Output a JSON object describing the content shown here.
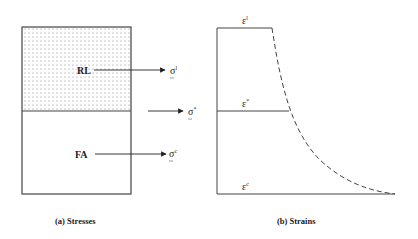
{
  "stresses": {
    "caption": "(a) Stresses",
    "upper_region_label": "RL",
    "lower_region_label": "FA",
    "top_stress": {
      "symbol": "σ",
      "superscript": "l"
    },
    "mid_stress": {
      "symbol": "σ",
      "superscript": "*"
    },
    "bottom_stress": {
      "symbol": "σ",
      "superscript": "c"
    }
  },
  "strains": {
    "caption": "(b) Strains",
    "top_strain": {
      "symbol": "ε",
      "superscript": "l"
    },
    "mid_strain": {
      "symbol": "ε",
      "superscript": "*"
    },
    "bottom_strain": {
      "symbol": "ε",
      "superscript": "c"
    }
  },
  "colors": {
    "line": "#333333",
    "dots": "#777777"
  }
}
